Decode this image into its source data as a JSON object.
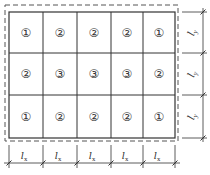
{
  "diagram": {
    "grid": {
      "rows": 3,
      "cols": 5,
      "cells": [
        [
          "①",
          "②",
          "②",
          "②",
          "①"
        ],
        [
          "②",
          "③",
          "③",
          "③",
          "②"
        ],
        [
          "①",
          "②",
          "②",
          "②",
          "①"
        ]
      ]
    },
    "x_dimension": {
      "label": "l",
      "subscript": "x",
      "count": 5
    },
    "y_dimension": {
      "label": "l",
      "subscript": "y",
      "count": 3
    },
    "colors": {
      "line": "#333333",
      "dashed_border": "#555555",
      "background": "#ffffff"
    }
  }
}
